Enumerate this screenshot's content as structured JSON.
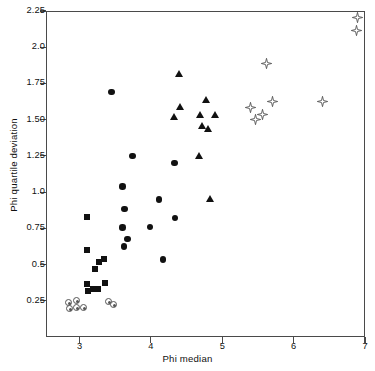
{
  "chart_data": {
    "type": "scatter",
    "title": "",
    "xlabel": "Phi median",
    "ylabel": "Phi quartile deviation",
    "xlim": [
      2.53,
      7.0
    ],
    "ylim": [
      0.0,
      2.25
    ],
    "xticks": [
      3,
      4,
      5,
      6,
      7
    ],
    "xtick_labels": [
      "3",
      "4",
      "5",
      "6",
      "7"
    ],
    "yticks": [
      0.25,
      0.5,
      0.75,
      1.0,
      1.25,
      1.5,
      1.75,
      2.0,
      2.25
    ],
    "ytick_labels": [
      "0.25",
      "0.5",
      "0.75",
      "1.0",
      "1.25",
      "1.50",
      "1.75",
      "2.0",
      "2.25"
    ],
    "grid": false,
    "legend": "none",
    "series": [
      {
        "name": "circled-dot",
        "marker": "dotcircle",
        "color": "#555555",
        "points": [
          [
            2.85,
            0.24
          ],
          [
            2.96,
            0.255
          ],
          [
            2.86,
            0.2
          ],
          [
            2.96,
            0.205
          ],
          [
            3.05,
            0.205
          ],
          [
            3.4,
            0.245
          ],
          [
            3.47,
            0.225
          ]
        ]
      },
      {
        "name": "squares",
        "marker": "square",
        "color": "#111111",
        "points": [
          [
            3.11,
            0.83
          ],
          [
            3.1,
            0.6
          ],
          [
            3.21,
            0.47
          ],
          [
            3.27,
            0.52
          ],
          [
            3.34,
            0.535
          ],
          [
            3.11,
            0.365
          ],
          [
            3.12,
            0.315
          ],
          [
            3.19,
            0.33
          ],
          [
            3.26,
            0.33
          ],
          [
            3.36,
            0.37
          ]
        ]
      },
      {
        "name": "filled-circles",
        "marker": "circle",
        "color": "#111111",
        "points": [
          [
            3.45,
            1.69
          ],
          [
            3.74,
            1.25
          ],
          [
            3.6,
            1.04
          ],
          [
            4.33,
            1.2
          ],
          [
            4.11,
            0.95
          ],
          [
            3.63,
            0.885
          ],
          [
            3.6,
            0.755
          ],
          [
            4.34,
            0.82
          ],
          [
            3.99,
            0.76
          ],
          [
            3.67,
            0.675
          ],
          [
            3.62,
            0.625
          ],
          [
            4.17,
            0.535
          ]
        ]
      },
      {
        "name": "filled-triangles",
        "marker": "triangle",
        "color": "#111111",
        "points": [
          [
            4.4,
            1.815
          ],
          [
            4.42,
            1.59
          ],
          [
            4.78,
            1.64
          ],
          [
            4.33,
            1.52
          ],
          [
            4.69,
            1.535
          ],
          [
            4.9,
            1.535
          ],
          [
            4.72,
            1.455
          ],
          [
            4.81,
            1.435
          ],
          [
            4.68,
            1.25
          ],
          [
            4.84,
            0.955
          ]
        ]
      },
      {
        "name": "open-stars",
        "marker": "star",
        "color": "#555555",
        "points": [
          [
            6.9,
            2.225
          ],
          [
            6.88,
            2.135
          ],
          [
            5.62,
            1.905
          ],
          [
            5.4,
            1.605
          ],
          [
            5.71,
            1.645
          ],
          [
            6.41,
            1.645
          ],
          [
            5.46,
            1.525
          ],
          [
            5.56,
            1.555
          ]
        ]
      }
    ]
  },
  "axes": {
    "x_axis_title": "Phi median",
    "y_axis_title": "Phi quartile deviation"
  }
}
